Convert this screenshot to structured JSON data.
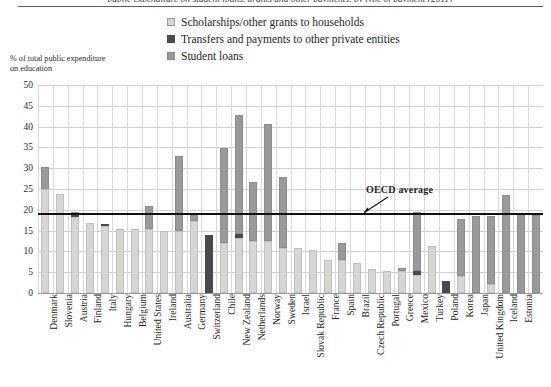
{
  "caption_sliver": "public expenditure on student loans, grants and other payments, by type of payment (2011)",
  "legend": {
    "items": [
      {
        "label": "Scholarships/other grants to households",
        "swatch": "#d6d6d4",
        "name": "legend-scholarships"
      },
      {
        "label": "Transfers and payments to other private entities",
        "swatch": "#4a4a4a",
        "name": "legend-transfers"
      },
      {
        "label": "Student loans",
        "swatch": "#9a9a9a",
        "name": "legend-student-loans"
      }
    ]
  },
  "axis": {
    "ylabel_line1": "% of total public expenditure",
    "ylabel_line2": "on education",
    "ticks": [
      "50",
      "45",
      "40",
      "35",
      "30",
      "25",
      "20",
      "15",
      "10",
      "5",
      "0"
    ]
  },
  "annotation": {
    "oecd_label": "OECD average",
    "oecd_value": 19
  },
  "chart_data": {
    "type": "bar",
    "title": "",
    "xlabel": "",
    "ylabel": "% of total public expenditure on education",
    "ylim": [
      0,
      50
    ],
    "ytick_step": 5,
    "grid": true,
    "stacked": true,
    "legend_position": "top-center",
    "colors": {
      "scholarships": "#d6d6d4",
      "transfers": "#4a4a4a",
      "student_loans": "#9a9a9a",
      "oecd_average_line": "#111111",
      "gridline": "#cfcfcf"
    },
    "series": [
      {
        "name": "Scholarships/other grants to households",
        "key": "scholarships",
        "values": [
          25.0,
          23.7,
          18.2,
          16.9,
          16.1,
          15.5,
          15.4,
          15.3,
          15.0,
          15.0,
          17.2,
          0.0,
          12.0,
          13.3,
          12.6,
          12.4,
          10.9,
          10.8,
          10.4,
          8.0,
          7.9,
          7.3,
          5.8,
          5.4,
          5.3,
          4.3,
          11.2,
          0.0,
          4.0,
          0.0,
          2.2,
          0.0,
          0.0,
          0.0
        ]
      },
      {
        "name": "Transfers and payments to other private entities",
        "key": "transfers",
        "values": [
          0.0,
          0.0,
          0.8,
          0.0,
          0.5,
          0.0,
          0.0,
          0.0,
          0.0,
          0.0,
          0.0,
          13.9,
          0.0,
          1.0,
          0.0,
          0.0,
          0.0,
          0.0,
          0.0,
          0.0,
          0.0,
          0.0,
          0.0,
          0.0,
          0.0,
          1.1,
          0.0,
          2.8,
          0.0,
          0.0,
          0.0,
          0.0,
          0.0,
          0.0
        ]
      },
      {
        "name": "Student loans",
        "key": "student_loans",
        "values": [
          5.3,
          0.0,
          0.5,
          0.0,
          0.0,
          0.0,
          0.0,
          5.5,
          0.0,
          18.0,
          1.5,
          0.0,
          22.9,
          28.5,
          14.2,
          28.2,
          16.9,
          0.0,
          0.0,
          0.0,
          4.2,
          0.0,
          0.0,
          0.0,
          0.7,
          14.1,
          0.0,
          0.0,
          13.9,
          18.6,
          16.2,
          23.5,
          19.2,
          18.7
        ]
      }
    ],
    "categories": [
      "Denmark",
      "Slovenia",
      "Austria",
      "Finland",
      "Italy",
      "Hungary",
      "Belgium",
      "United States",
      "Ireland",
      "Australia",
      "Germany",
      "Switzerland",
      "Chile",
      "New Zealand",
      "Netherlands",
      "Norway",
      "Sweden",
      "Israel",
      "Slovak Republic",
      "France",
      "Spain",
      "Brazil",
      "Czech Republic",
      "Portugal",
      "Greece",
      "Mexico",
      "Turkey",
      "Poland",
      "Korea",
      "Japan",
      "United Kingdom",
      "Iceland",
      "Estonia",
      ""
    ],
    "totals": [
      30.3,
      23.7,
      19.5,
      16.9,
      16.6,
      15.5,
      15.4,
      20.8,
      15.0,
      33.0,
      18.7,
      13.9,
      34.9,
      42.8,
      26.8,
      40.6,
      27.8,
      10.8,
      10.4,
      8.0,
      12.1,
      7.3,
      5.8,
      5.4,
      6.0,
      19.5,
      11.2,
      2.8,
      17.9,
      18.6,
      18.4,
      23.5,
      19.2,
      18.7
    ]
  }
}
